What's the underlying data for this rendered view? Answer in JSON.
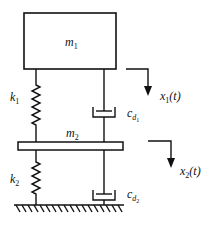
{
  "diagram": {
    "type": "two-degree-of-freedom mass-spring-damper system",
    "masses": [
      {
        "id": "m1",
        "symbol": "m",
        "subscript": "1"
      },
      {
        "id": "m2",
        "symbol": "m",
        "subscript": "2"
      }
    ],
    "springs": [
      {
        "id": "k1",
        "symbol": "k",
        "subscript": "1"
      },
      {
        "id": "k2",
        "symbol": "k",
        "subscript": "2"
      }
    ],
    "dampers": [
      {
        "id": "cd1",
        "symbol": "c",
        "sub1": "d",
        "sub2": "1"
      },
      {
        "id": "cd2",
        "symbol": "c",
        "sub1": "d",
        "sub2": "2"
      }
    ],
    "displacements": [
      {
        "id": "x1",
        "symbol": "x",
        "subscript": "1",
        "arg": "(t)"
      },
      {
        "id": "x2",
        "symbol": "x",
        "subscript": "2",
        "arg": "(t)"
      }
    ],
    "colors": {
      "stroke": "#111111",
      "background": "#ffffff"
    }
  }
}
